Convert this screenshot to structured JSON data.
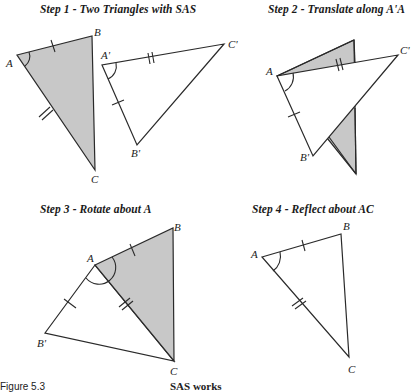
{
  "colors": {
    "line": "#2a2a2a",
    "shade": "#c8c8c8",
    "background": "#ffffff"
  },
  "panels": [
    {
      "id": "step1",
      "title": "Step 1 - Two Triangles with SAS",
      "labels": {
        "A": "A",
        "B": "B",
        "C": "C",
        "A_prime": "A'",
        "B_prime": "B'",
        "C_prime": "C'"
      }
    },
    {
      "id": "step2",
      "title": "Step 2 - Translate along A'A",
      "labels": {
        "A": "A",
        "B_prime": "B'",
        "C_prime": "C'"
      }
    },
    {
      "id": "step3",
      "title": "Step 3 - Rotate about A",
      "labels": {
        "A": "A",
        "B": "B",
        "C": "C",
        "B_prime": "B'"
      }
    },
    {
      "id": "step4",
      "title": "Step 4 - Reflect about AC",
      "labels": {
        "A": "A",
        "B": "B",
        "C": "C"
      }
    }
  ],
  "caption": {
    "left": "Figure 5.3",
    "right": "SAS works"
  }
}
